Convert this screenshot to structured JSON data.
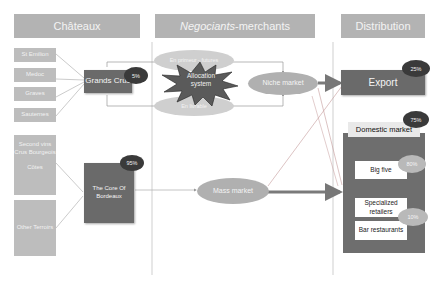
{
  "columns": {
    "chateaux": "Châteaux",
    "negociants_italic": "Negociants",
    "negociants_rest": "-merchants",
    "distribution": "Distribution"
  },
  "sources": {
    "st_emilion": "St Emilion",
    "medoc": "Medoc",
    "graves": "Graves",
    "sauternes": "Sauternes",
    "second_vins": "Second vins Crus Bourgeois",
    "cotes": "Côtes",
    "other_terroirs": "Other Terroirs"
  },
  "producers": {
    "grands_crus": "Grands Crus",
    "grands_crus_share": "5%",
    "core_bordeaux": "The Core Of Bordeaux",
    "core_bordeaux_share": "95%"
  },
  "negociants": {
    "en_primeur": "En primeur - futures",
    "allocation": "Allocation system",
    "en_livrable": "En livrable",
    "niche_market": "Niche market",
    "mass_market": "Mass market"
  },
  "distribution": {
    "export": "Export",
    "export_share": "25%",
    "domestic": "Domestic market",
    "domestic_share": "75%",
    "big_five": "Big five",
    "big_five_share": "80%",
    "specialized": "Specialized retailers",
    "bar_restaurants": "Bar restaurants",
    "other_share": "10%"
  },
  "colors": {
    "header_bg": "#b3b3b3",
    "dark_box": "#6a6a6a",
    "badge_dark": "#3a3a3a",
    "arrow": "#7a7a7a"
  }
}
